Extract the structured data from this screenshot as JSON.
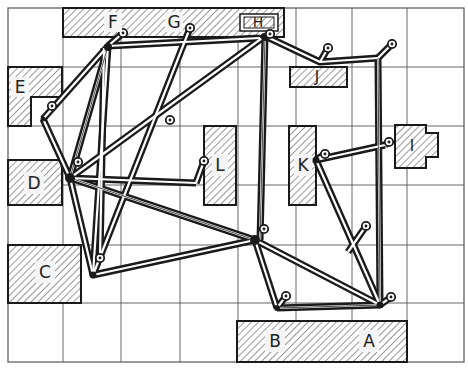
{
  "diagram": {
    "type": "facility layout with cable/flow routing",
    "grid": {
      "x_lines": [
        8,
        63,
        121,
        180,
        238,
        296,
        352,
        407,
        464
      ],
      "y_lines": [
        8,
        67,
        126,
        185,
        245,
        303,
        362
      ],
      "color": "#555555"
    },
    "colors": {
      "ink": "#1a1a1a",
      "hatch": "#444444",
      "paper": "#ffffff"
    },
    "blocks": [
      {
        "id": "F",
        "label": "F",
        "label_x": 113,
        "label_y": 22
      },
      {
        "id": "G",
        "label": "G",
        "label_x": 174,
        "label_y": 22
      },
      {
        "id": "H",
        "label": "H",
        "label_x": 256,
        "label_y": 22
      },
      {
        "id": "E",
        "label": "E",
        "label_x": 20,
        "label_y": 87
      },
      {
        "id": "D",
        "label": "D",
        "label_x": 34,
        "label_y": 183
      },
      {
        "id": "C",
        "label": "C",
        "label_x": 45,
        "label_y": 272
      },
      {
        "id": "L",
        "label": "L",
        "label_x": 220,
        "label_y": 165
      },
      {
        "id": "K",
        "label": "K",
        "label_x": 303,
        "label_y": 165
      },
      {
        "id": "J",
        "label": "J",
        "label_x": 317,
        "label_y": 77
      },
      {
        "id": "I",
        "label": "I",
        "label_x": 412,
        "label_y": 146
      },
      {
        "id": "B",
        "label": "B",
        "label_x": 275,
        "label_y": 341
      },
      {
        "id": "A",
        "label": "A",
        "label_x": 369,
        "label_y": 341
      }
    ],
    "pins": [
      {
        "id": "pin-F",
        "x": 123,
        "y": 33
      },
      {
        "id": "pin-G",
        "x": 190,
        "y": 28
      },
      {
        "id": "pin-H",
        "x": 270,
        "y": 34
      },
      {
        "id": "pin-J",
        "x": 328,
        "y": 48
      },
      {
        "id": "pin-right",
        "x": 392,
        "y": 44
      },
      {
        "id": "pin-E",
        "x": 52,
        "y": 106
      },
      {
        "id": "pin-mid",
        "x": 170,
        "y": 120
      },
      {
        "id": "pin-D",
        "x": 78,
        "y": 162
      },
      {
        "id": "pin-L",
        "x": 204,
        "y": 161
      },
      {
        "id": "pin-K",
        "x": 325,
        "y": 154
      },
      {
        "id": "pin-I",
        "x": 389,
        "y": 142
      },
      {
        "id": "pin-center",
        "x": 264,
        "y": 229
      },
      {
        "id": "pin-right2",
        "x": 366,
        "y": 226
      },
      {
        "id": "pin-C",
        "x": 100,
        "y": 258
      },
      {
        "id": "pin-B",
        "x": 286,
        "y": 296
      },
      {
        "id": "pin-A",
        "x": 391,
        "y": 297
      }
    ]
  }
}
